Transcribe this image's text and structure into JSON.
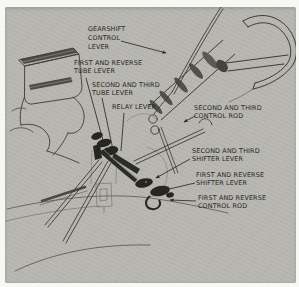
{
  "figure": {
    "labels": [
      {
        "id": "gearshift-control-lever",
        "text": "GEARSHIFT\nCONTROL\nLEVER"
      },
      {
        "id": "first-and-reverse-tube-lever",
        "text": "FIRST AND REVERSE\nTUBE LEVER"
      },
      {
        "id": "second-and-third-tube-lever",
        "text": "SECOND AND THIRD\nTUBE LEVER"
      },
      {
        "id": "relay-lever",
        "text": "RELAY LEVER"
      },
      {
        "id": "second-and-third-control-rod",
        "text": "SECOND AND THIRD\nCONTROL ROD"
      },
      {
        "id": "second-and-third-shifter-lever",
        "text": "SECOND AND THIRD\nSHIFTER LEVER"
      },
      {
        "id": "first-and-reverse-shifter-lever",
        "text": "FIRST AND REVERSE\nSHIFTER LEVER"
      },
      {
        "id": "first-and-reverse-control-rod",
        "text": "FIRST AND REVERSE\nCONTROL ROD"
      }
    ]
  },
  "colors": {
    "page_bg": "#f7f7f4",
    "photo_bg": "#b7b6b1",
    "ink": "#3b3b36",
    "ink_dark": "#26261f",
    "ink_light": "#84847d",
    "label_ink": "#26261f"
  }
}
